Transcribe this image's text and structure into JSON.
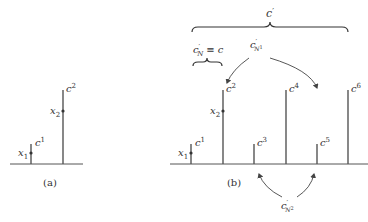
{
  "figure": {
    "panel_a": {
      "caption": "(a)",
      "bars": [
        {
          "label_base": "c",
          "label_sup": "1",
          "x": 31,
          "top": 144
        },
        {
          "label_base": "c",
          "label_sup": "2",
          "x": 63,
          "top": 90
        }
      ],
      "points": [
        {
          "label_base": "x",
          "label_sub": "1",
          "x": 31,
          "y": 153
        },
        {
          "label_base": "x",
          "label_sub": "2",
          "x": 63,
          "y": 111
        }
      ]
    },
    "panel_b": {
      "caption": "(b)",
      "bars": [
        {
          "label_base": "c",
          "label_sup": "1",
          "x": 191,
          "top": 144
        },
        {
          "label_base": "c",
          "label_sup": "2",
          "x": 223,
          "top": 90
        },
        {
          "label_base": "c",
          "label_sup": "3",
          "x": 254,
          "top": 144
        },
        {
          "label_base": "c",
          "label_sup": "4",
          "x": 286,
          "top": 90
        },
        {
          "label_base": "c",
          "label_sup": "5",
          "x": 317,
          "top": 144
        },
        {
          "label_base": "c",
          "label_sup": "6",
          "x": 348,
          "top": 90
        }
      ],
      "points": [
        {
          "label_base": "x",
          "label_sub": "1",
          "x": 191,
          "y": 153
        },
        {
          "label_base": "x",
          "label_sub": "2",
          "x": 223,
          "y": 111
        }
      ],
      "top_brace": {
        "label_base": "c",
        "label_prime": "′"
      },
      "small_brace": {
        "label_base": "c",
        "label_prime": "′",
        "label_sub": "N",
        "equiv": "≡",
        "rhs": "c"
      },
      "group_n1": {
        "label_base": "c",
        "label_prime": "′",
        "label_sub": "N",
        "label_subsup": "1"
      },
      "group_n2": {
        "label_base": "c",
        "label_prime": "′",
        "label_sub": "N",
        "label_subsup": "2"
      }
    }
  }
}
